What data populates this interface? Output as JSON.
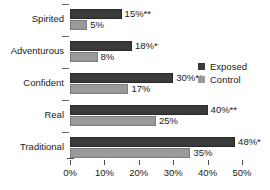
{
  "chart_data": {
    "type": "bar",
    "orientation": "horizontal",
    "title": "",
    "xlabel": "",
    "ylabel": "",
    "xlim": [
      0,
      50
    ],
    "grid": false,
    "legend_position": "right",
    "categories": [
      "Spirited",
      "Adventurous",
      "Confident",
      "Real",
      "Traditional"
    ],
    "tick_labels": [
      "0%",
      "10%",
      "20%",
      "30%",
      "40%",
      "50%"
    ],
    "tick_values": [
      0,
      10,
      20,
      30,
      40,
      50
    ],
    "series": [
      {
        "name": "Exposed",
        "color": "#3a3a3a",
        "values": [
          15,
          18,
          30,
          40,
          48
        ],
        "labels": [
          "15%**",
          "18%*",
          "30%**",
          "40%**",
          "48%*"
        ]
      },
      {
        "name": "Control",
        "color": "#9a9a9a",
        "values": [
          5,
          8,
          17,
          25,
          35
        ],
        "labels": [
          "5%",
          "8%",
          "17%",
          "25%",
          "35%"
        ]
      }
    ]
  },
  "legend": {
    "items": [
      {
        "label": "Exposed",
        "color": "#3a3a3a"
      },
      {
        "label": "Control",
        "color": "#9a9a9a"
      }
    ]
  }
}
